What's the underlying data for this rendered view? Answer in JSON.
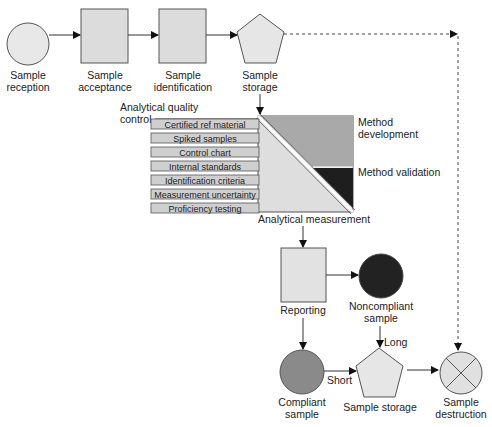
{
  "colors": {
    "light_fill": "#e6e6e6",
    "medium_fill": "#a8a8a8",
    "dark_fill": "#1e1e1e",
    "compliant_fill": "#8a8a8a",
    "stroke": "#555555",
    "qc_bar_fill": "#cfcfcf"
  },
  "top_flow": {
    "reception": {
      "line1": "Sample",
      "line2": "reception"
    },
    "acceptance": {
      "line1": "Sample",
      "line2": "acceptance"
    },
    "identification": {
      "line1": "Sample",
      "line2": "identification"
    },
    "storage": {
      "line1": "Sample",
      "line2": "storage"
    }
  },
  "quality_control": {
    "title_line1": "Analytical quality",
    "title_line2": "control",
    "items": [
      "Certified ref material",
      "Spiked samples",
      "Control chart",
      "Internal standards",
      "Identification criteria",
      "Measurement uncertainty",
      "Proficiency testing"
    ]
  },
  "method": {
    "development_line1": "Method",
    "development_line2": "development",
    "validation": "Method validation",
    "measurement": "Analytical measurement"
  },
  "bottom_flow": {
    "reporting": "Reporting",
    "noncompliant": {
      "line1": "Noncompliant",
      "line2": "sample"
    },
    "compliant": {
      "line1": "Compliant",
      "line2": "sample"
    },
    "storage": "Sample storage",
    "destruction": {
      "line1": "Sample",
      "line2": "destruction"
    },
    "short_label": "Short",
    "long_label": "Long"
  }
}
